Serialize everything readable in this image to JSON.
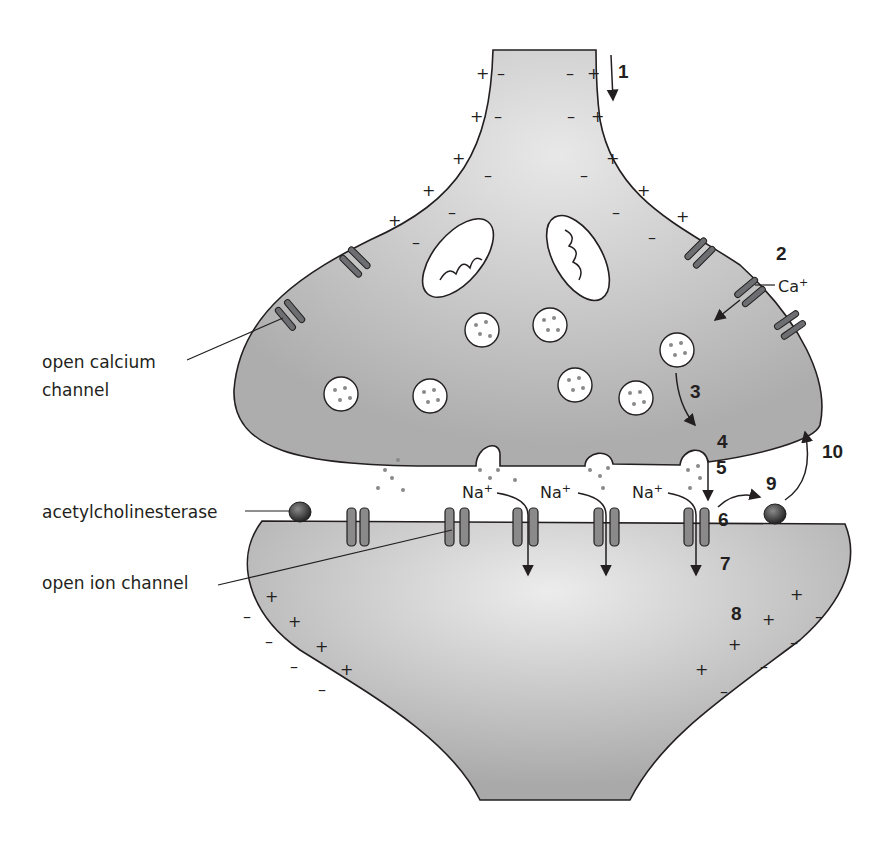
{
  "diagram": {
    "labels": {
      "open_calcium_channel_line1": "open calcium",
      "open_calcium_channel_line2": "channel",
      "acetylcholinesterase": "acetylcholinesterase",
      "open_ion_channel": "open ion channel",
      "calcium_ion": "Ca",
      "calcium_charge": "+",
      "sodium_ion": "Na",
      "sodium_charge": "+"
    },
    "steps": [
      "1",
      "2",
      "3",
      "4",
      "5",
      "6",
      "7",
      "8",
      "9",
      "10"
    ],
    "signs": {
      "plus": "+",
      "minus": "–"
    },
    "colors": {
      "background": "#ffffff",
      "cell_fill": "#b3b3b3",
      "cell_fill_light": "#e6e6e6",
      "outline": "#231f20",
      "channel": "#6d6e71",
      "vesicle_fill": "#ffffff",
      "vesicle_dot": "#8a8a8a"
    }
  }
}
